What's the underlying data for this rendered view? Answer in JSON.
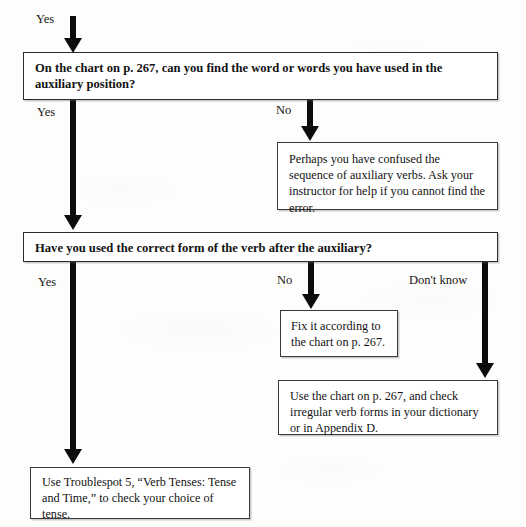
{
  "diagram": {
    "type": "flowchart",
    "nodes": [
      {
        "id": "q1",
        "kind": "question",
        "text": "On the chart on p. 267, can you find the word or words you have used in the auxiliary position?"
      },
      {
        "id": "a1",
        "kind": "action",
        "text": "Perhaps you have confused the sequence of auxiliary verbs. Ask your instructor for help if you cannot find the error."
      },
      {
        "id": "q2",
        "kind": "question",
        "text": "Have you used the correct form of the verb after the auxiliary?"
      },
      {
        "id": "a2",
        "kind": "action",
        "text": "Fix it according to the chart on p. 267."
      },
      {
        "id": "a3",
        "kind": "action",
        "text": "Use the chart on p. 267, and check irregular verb forms in your dictionary or in Appendix D."
      },
      {
        "id": "a4",
        "kind": "action",
        "text": "Use Troublespot 5, “Verb Tenses: Tense and Time,” to check your choice of tense."
      }
    ],
    "edges": [
      {
        "id": "e0",
        "label": "Yes",
        "from": "entry",
        "to": "q1"
      },
      {
        "id": "e1",
        "label": "Yes",
        "from": "q1",
        "to": "q2"
      },
      {
        "id": "e2",
        "label": "No",
        "from": "q1",
        "to": "a1"
      },
      {
        "id": "e3",
        "label": "Yes",
        "from": "q2",
        "to": "a4"
      },
      {
        "id": "e4",
        "label": "No",
        "from": "q2",
        "to": "a2"
      },
      {
        "id": "e5",
        "label": "Don't know",
        "from": "q2",
        "to": "a3"
      }
    ]
  }
}
